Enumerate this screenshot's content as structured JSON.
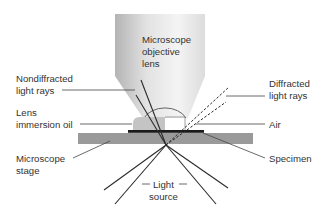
{
  "labels": {
    "objective": [
      "Microscope",
      "objective",
      "lens"
    ],
    "nondiffracted": [
      "Nondiffracted",
      "light rays"
    ],
    "diffracted": [
      "Diffracted",
      "light rays"
    ],
    "oil": [
      "Lens",
      "immersion oil"
    ],
    "air": [
      "Air"
    ],
    "stage": [
      "Microscope",
      "stage"
    ],
    "specimen": [
      "Specimen"
    ],
    "light_source": [
      "Light",
      "source"
    ]
  },
  "colors": {
    "objective_light": "#f2f2f2",
    "objective_dark": "#b8b8b8",
    "stage": "#9a9a9a",
    "oil": "#c4c4c4",
    "specimen": "#1a1a1a",
    "text": "#333333"
  }
}
